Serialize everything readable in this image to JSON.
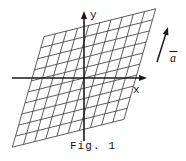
{
  "figure": {
    "caption": "Fig. 1",
    "axes": {
      "x_label": "x",
      "y_label": "y",
      "origin": {
        "x": 84,
        "y": 78
      },
      "x_axis": {
        "x_start": 12,
        "x_end": 147,
        "y": 78
      },
      "y_axis": {
        "y_start": 11,
        "y_end": 141,
        "x": 84
      }
    },
    "vector": {
      "label": "a",
      "label_overbar": true,
      "label_display": "ā",
      "x_start": 157,
      "y_start": 62,
      "x_end": 168,
      "y_end": 27
    },
    "lattice": {
      "description": "oblique sheared grid of parallelograms",
      "spacing_px": 11.5,
      "family_a_angle_deg": 74,
      "family_b_angle_deg": 14,
      "line_count_a": 11,
      "line_count_b": 11,
      "center": {
        "x": 84,
        "y": 78
      }
    },
    "colors": {
      "background": "#ffffff",
      "axis": "#1a1a1a",
      "grid": "#4a4a4a",
      "text": "#141414"
    }
  }
}
